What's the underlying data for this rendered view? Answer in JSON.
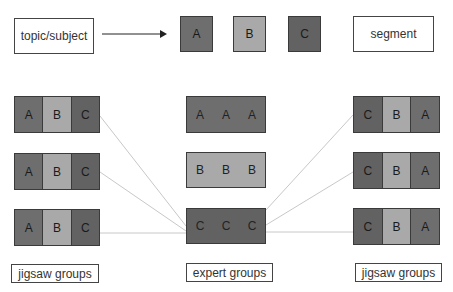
{
  "legend": {
    "topic_label": "topic/subject",
    "segments": [
      {
        "letter": "A",
        "color": "#6e6e6e"
      },
      {
        "letter": "B",
        "color": "#a9a9a9"
      },
      {
        "letter": "C",
        "color": "#626262"
      }
    ],
    "segment_label": "segment"
  },
  "jigsaw_left": {
    "groups": [
      {
        "cells": [
          "A",
          "B",
          "C"
        ]
      },
      {
        "cells": [
          "A",
          "B",
          "C"
        ]
      },
      {
        "cells": [
          "A",
          "B",
          "C"
        ]
      }
    ],
    "label": "jigsaw groups"
  },
  "expert": {
    "groups": [
      {
        "cells": [
          "A",
          "A",
          "A"
        ],
        "color": "#6e6e6e"
      },
      {
        "cells": [
          "B",
          "B",
          "B"
        ],
        "color": "#a9a9a9"
      },
      {
        "cells": [
          "C",
          "C",
          "C"
        ],
        "color": "#626262"
      }
    ],
    "label": "expert groups"
  },
  "jigsaw_right": {
    "groups": [
      {
        "cells": [
          "C",
          "B",
          "A"
        ]
      },
      {
        "cells": [
          "C",
          "B",
          "A"
        ]
      },
      {
        "cells": [
          "C",
          "B",
          "A"
        ]
      }
    ],
    "label": "jigsaw groups"
  },
  "colors": {
    "segment_a": "#6e6e6e",
    "segment_b": "#a9a9a9",
    "segment_c": "#626262",
    "connector": "#c8c8c8",
    "border": "#3a3a3a"
  }
}
